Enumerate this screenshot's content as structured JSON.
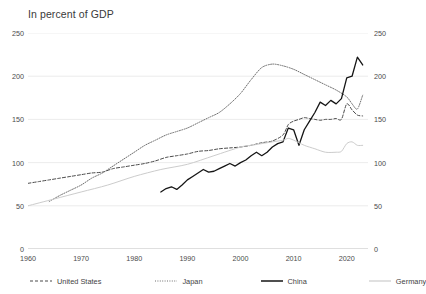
{
  "chart_data": {
    "type": "line",
    "title": "In percent of GDP",
    "xlabel": "",
    "ylabel": "",
    "xlim": [
      1960,
      2024
    ],
    "ylim": [
      0,
      250
    ],
    "grid": true,
    "grid_axis": "y",
    "legend_position": "bottom",
    "yticks": [
      0,
      50,
      100,
      150,
      200,
      250
    ],
    "yticks_right": [
      0,
      50,
      100,
      150,
      200,
      250
    ],
    "xticks": [
      1960,
      1970,
      1980,
      1990,
      2000,
      2010,
      2020
    ],
    "ytick_labels": [
      "0",
      "50",
      "100",
      "150",
      "200",
      "250"
    ],
    "ytick_labels_right": [
      "0",
      "50",
      "100",
      "150",
      "200",
      "250"
    ],
    "xtick_labels": [
      "1960",
      "1970",
      "1980",
      "1990",
      "2000",
      "2010",
      "2020"
    ],
    "series": [
      {
        "name": "United States",
        "style": "dashed",
        "color": "#4a4a4a",
        "x": [
          1960,
          1962,
          1964,
          1966,
          1968,
          1970,
          1972,
          1974,
          1976,
          1978,
          1980,
          1982,
          1984,
          1986,
          1988,
          1990,
          1992,
          1994,
          1996,
          1998,
          2000,
          2002,
          2004,
          2006,
          2008,
          2009,
          2010,
          2011,
          2012,
          2013,
          2014,
          2015,
          2016,
          2017,
          2018,
          2019,
          2020,
          2021,
          2022,
          2023
        ],
        "values": [
          76,
          78,
          80,
          82,
          84,
          86,
          88,
          89,
          93,
          95,
          97,
          99,
          102,
          106,
          108,
          110,
          113,
          114,
          116,
          117,
          118,
          120,
          123,
          125,
          132,
          144,
          148,
          150,
          152,
          151,
          150,
          149,
          150,
          150,
          151,
          150,
          168,
          161,
          155,
          154
        ]
      },
      {
        "name": "Japan",
        "style": "dotted",
        "color": "#6e6e6e",
        "x": [
          1964,
          1966,
          1968,
          1970,
          1972,
          1974,
          1976,
          1978,
          1980,
          1982,
          1984,
          1986,
          1988,
          1990,
          1992,
          1994,
          1996,
          1998,
          2000,
          2002,
          2004,
          2006,
          2008,
          2010,
          2012,
          2014,
          2016,
          2018,
          2020,
          2021,
          2022,
          2023
        ],
        "values": [
          55,
          62,
          68,
          74,
          82,
          88,
          96,
          104,
          112,
          120,
          126,
          132,
          136,
          140,
          146,
          152,
          158,
          168,
          180,
          196,
          210,
          214,
          212,
          208,
          202,
          196,
          190,
          184,
          176,
          168,
          162,
          178
        ]
      },
      {
        "name": "China",
        "style": "solid",
        "color": "#151515",
        "x": [
          1985,
          1986,
          1987,
          1988,
          1989,
          1990,
          1991,
          1992,
          1993,
          1994,
          1995,
          1996,
          1997,
          1998,
          1999,
          2000,
          2001,
          2002,
          2003,
          2004,
          2005,
          2006,
          2007,
          2008,
          2009,
          2010,
          2011,
          2012,
          2013,
          2014,
          2015,
          2016,
          2017,
          2018,
          2019,
          2020,
          2021,
          2022,
          2023
        ],
        "values": [
          66,
          70,
          72,
          69,
          74,
          80,
          84,
          88,
          92,
          89,
          90,
          93,
          96,
          99,
          96,
          100,
          103,
          108,
          112,
          108,
          112,
          118,
          122,
          124,
          140,
          138,
          120,
          138,
          148,
          158,
          170,
          166,
          172,
          168,
          174,
          198,
          200,
          222,
          213
        ]
      },
      {
        "name": "Germany",
        "style": "solid-light",
        "color": "#cccccc",
        "x": [
          1960,
          1965,
          1970,
          1975,
          1980,
          1985,
          1990,
          1995,
          2000,
          2002,
          2004,
          2006,
          2008,
          2009,
          2010,
          2012,
          2014,
          2016,
          2018,
          2019,
          2020,
          2021,
          2022,
          2023
        ],
        "values": [
          50,
          58,
          66,
          74,
          84,
          92,
          98,
          108,
          118,
          120,
          122,
          124,
          126,
          128,
          126,
          120,
          116,
          112,
          112,
          113,
          122,
          124,
          120,
          120
        ]
      }
    ]
  },
  "legend": {
    "items": [
      {
        "label": "United States",
        "key": "us"
      },
      {
        "label": "Japan",
        "key": "jp"
      },
      {
        "label": "China",
        "key": "cn"
      },
      {
        "label": "Germany",
        "key": "de"
      }
    ]
  },
  "colors": {
    "united_states": "#4a4a4a",
    "japan": "#6e6e6e",
    "china": "#151515",
    "germany": "#cccccc",
    "grid": "#e4e4e4",
    "axis": "#b8b8b8",
    "text": "#3f3f3f"
  }
}
